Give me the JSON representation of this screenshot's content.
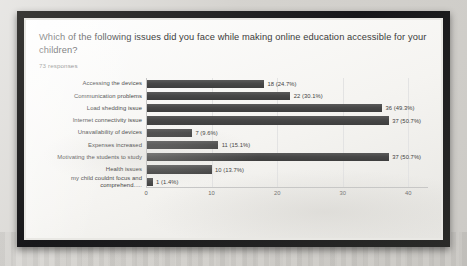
{
  "form": {
    "question": "Which of the following issues did you face while making online education accessible for your children?",
    "responses_label": "73 responses"
  },
  "chart_data": {
    "type": "bar",
    "orientation": "horizontal",
    "title": "Which of the following issues did you face while making online education accessible for your children?",
    "subtitle": "73 responses",
    "xlabel": "",
    "ylabel": "",
    "xlim": [
      0,
      43
    ],
    "grid": true,
    "legend": false,
    "total_responses": 73,
    "bar_color": "#474747",
    "xticks": [
      0,
      10,
      20,
      30,
      40
    ],
    "xtick_labels": [
      "0",
      "10",
      "20",
      "30",
      "40"
    ],
    "categories": [
      "Accessing the devices",
      "Communication problems",
      "Load shedding issue",
      "Internet connectivity issue",
      "Unavailability of devices",
      "Expenses increased",
      "Motivating the students to study",
      "Health issues",
      "my child couldnt focus and comprehend....."
    ],
    "values": [
      18,
      22,
      36,
      37,
      7,
      11,
      37,
      10,
      1
    ],
    "percents": [
      24.7,
      30.1,
      49.3,
      50.7,
      9.6,
      15.1,
      50.7,
      13.7,
      1.4
    ],
    "value_labels": [
      "18 (24.7%)",
      "22 (30.1%)",
      "36 (49.3%)",
      "37 (50.7%)",
      "7 (9.6%)",
      "11 (15.1%)",
      "37 (50.7%)",
      "10 (13.7%)",
      "1 (1.4%)"
    ]
  }
}
